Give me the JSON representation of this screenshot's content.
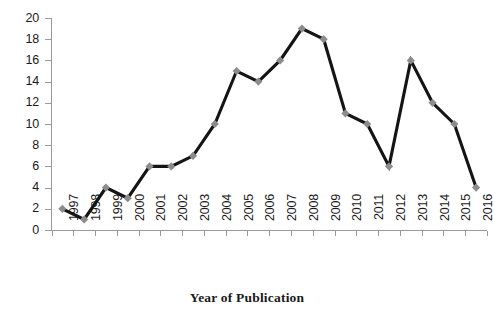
{
  "chart_data": {
    "type": "line",
    "title": "",
    "xlabel": "Year of Publication",
    "ylabel": "",
    "categories": [
      "1997",
      "1998",
      "1999",
      "2000",
      "2001",
      "2002",
      "2003",
      "2004",
      "2005",
      "2006",
      "2007",
      "2008",
      "2009",
      "2010",
      "2011",
      "2012",
      "2013",
      "2014",
      "2015",
      "2016"
    ],
    "values": [
      2,
      1,
      4,
      3,
      6,
      6,
      7,
      10,
      15,
      14,
      16,
      19,
      18,
      11,
      10,
      6,
      16,
      12,
      10,
      4
    ],
    "series": [
      {
        "name": "Publications",
        "values": [
          2,
          1,
          4,
          3,
          6,
          6,
          7,
          10,
          15,
          14,
          16,
          19,
          18,
          11,
          10,
          6,
          16,
          12,
          10,
          4
        ]
      }
    ],
    "ylim": [
      0,
      20
    ],
    "ytick_step": 2,
    "yticks": [
      0,
      2,
      4,
      6,
      8,
      10,
      12,
      14,
      16,
      18,
      20
    ],
    "grid": false,
    "legend": "none",
    "marker": "diamond",
    "marker_color": "#8c8c8c",
    "line_color": "#141414",
    "axis_color": "#9a9a9a",
    "text_color": "#1a1a1a"
  }
}
